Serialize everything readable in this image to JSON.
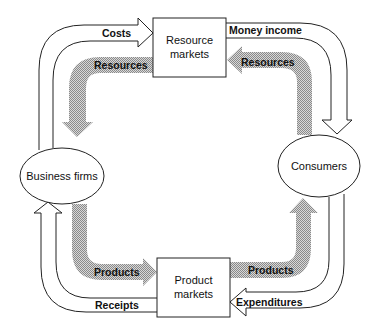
{
  "diagram": {
    "type": "circular-flow",
    "nodes": {
      "resource_markets": {
        "line1": "Resource",
        "line2": "markets"
      },
      "product_markets": {
        "line1": "Product",
        "line2": "markets"
      },
      "business_firms": {
        "label": "Business firms"
      },
      "consumers": {
        "label": "Consumers"
      }
    },
    "money_flows": {
      "costs": "Costs",
      "money_income": "Money income",
      "expenditures": "Expenditures",
      "receipts": "Receipts"
    },
    "real_flows": {
      "resources_left": "Resources",
      "resources_right": "Resources",
      "products_left": "Products",
      "products_right": "Products"
    },
    "colors": {
      "stroke": "#222222",
      "real_flow_fill": "#a8a8a8",
      "background": "#ffffff"
    }
  }
}
